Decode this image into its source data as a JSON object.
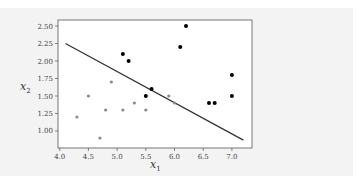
{
  "chart_data": {
    "type": "scatter",
    "title": "",
    "xlabel": "x_1",
    "ylabel": "x_2",
    "xlim": [
      3.97,
      7.35
    ],
    "ylim": [
      0.757,
      2.586
    ],
    "grid": false,
    "legend": null,
    "x_ticks": [
      4.0,
      4.5,
      5.0,
      5.5,
      6.0,
      6.5,
      7.0
    ],
    "x_tick_labels": [
      "4.0",
      "4.5",
      "5.0",
      "5.5",
      "6.0",
      "6.5",
      "7.0"
    ],
    "y_ticks": [
      1.0,
      1.25,
      1.5,
      1.75,
      2.0,
      2.25,
      2.5
    ],
    "y_tick_labels": [
      "1.00",
      "1.25",
      "1.50",
      "1.75",
      "2.00",
      "2.25",
      "2.50"
    ],
    "series": [
      {
        "name": "class-dark",
        "color": "#000000",
        "points": [
          [
            5.1,
            2.1
          ],
          [
            5.2,
            2.0
          ],
          [
            6.1,
            2.2
          ],
          [
            6.2,
            2.5
          ],
          [
            5.5,
            1.5
          ],
          [
            5.6,
            1.6
          ],
          [
            6.6,
            1.4
          ],
          [
            6.7,
            1.4
          ],
          [
            7.0,
            1.8
          ],
          [
            7.0,
            1.5
          ]
        ]
      },
      {
        "name": "class-light",
        "color": "#8a8a8a",
        "points": [
          [
            4.3,
            1.2
          ],
          [
            4.5,
            1.5
          ],
          [
            4.7,
            0.9
          ],
          [
            4.8,
            1.3
          ],
          [
            4.9,
            1.7
          ],
          [
            5.1,
            1.3
          ],
          [
            5.3,
            1.4
          ],
          [
            5.5,
            1.3
          ],
          [
            5.9,
            1.5
          ],
          [
            6.0,
            1.4
          ]
        ]
      }
    ],
    "decision_boundary": {
      "type": "line",
      "color": "#333333",
      "points": [
        [
          4.1,
          2.25
        ],
        [
          7.2,
          0.87
        ]
      ]
    }
  },
  "colors": {
    "panel_background": "#f3f3f3",
    "plot_background": "#ffffff",
    "frame": "#555555"
  }
}
